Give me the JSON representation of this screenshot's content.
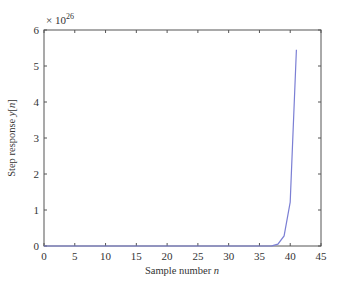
{
  "chart_data": {
    "type": "line",
    "title": "",
    "xlabel": "Sample number n",
    "ylabel": "Step response y[n]",
    "xlabel_parts": {
      "text": "Sample number ",
      "var": "n"
    },
    "ylabel_parts": {
      "text": "Step response ",
      "var": "y",
      "bracket_open": "[",
      "bracket_var": "n",
      "bracket_close": "]"
    },
    "y_multiplier": {
      "prefix": "× 10",
      "exponent": "26"
    },
    "xlim": [
      0,
      45
    ],
    "ylim": [
      0,
      6
    ],
    "xticks": [
      0,
      5,
      10,
      15,
      20,
      25,
      30,
      35,
      40,
      45
    ],
    "yticks": [
      0,
      1,
      2,
      3,
      4,
      5,
      6
    ],
    "grid": false,
    "legend": null,
    "line_color": "#7b7fd4",
    "series": [
      {
        "name": "y[n]",
        "x": [
          0,
          1,
          2,
          3,
          4,
          5,
          6,
          7,
          8,
          9,
          10,
          11,
          12,
          13,
          14,
          15,
          16,
          17,
          18,
          19,
          20,
          21,
          22,
          23,
          24,
          25,
          26,
          27,
          28,
          29,
          30,
          31,
          32,
          33,
          34,
          35,
          36,
          37,
          38,
          39,
          40,
          41
        ],
        "values": [
          0,
          0,
          0,
          0,
          0,
          0,
          0,
          0,
          0,
          0,
          0,
          0,
          0,
          0,
          0,
          0,
          0,
          0,
          0,
          0,
          0,
          0,
          0,
          0,
          0,
          0,
          0,
          0,
          0,
          0,
          0,
          0,
          0,
          0,
          0,
          0.0001,
          0.0005,
          0.003,
          0.05,
          0.28,
          1.22,
          5.45
        ]
      }
    ]
  }
}
